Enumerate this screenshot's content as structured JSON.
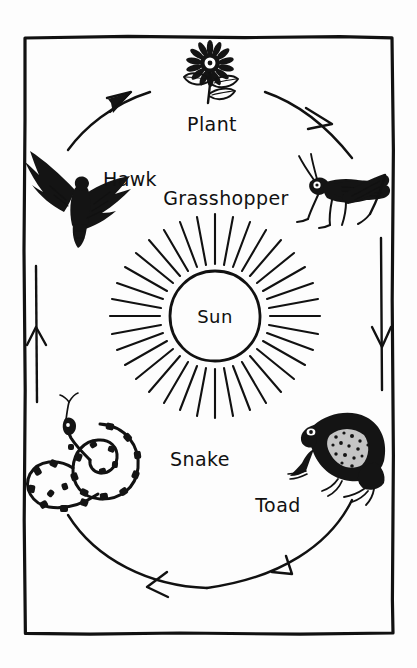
{
  "diagram": {
    "title_visible": false,
    "frame": {
      "type": "hand-drawn-rectangle",
      "color": "#111111"
    },
    "center": {
      "label": "Sun",
      "shape": "circle-with-rays",
      "ray_count": 36
    },
    "nodes": [
      {
        "id": "plant",
        "label": "Plant",
        "icon": "sunflower-illustration",
        "position": "top"
      },
      {
        "id": "grasshopper",
        "label": "Grasshopper",
        "icon": "grasshopper-illustration",
        "position": "right-upper"
      },
      {
        "id": "toad",
        "label": "Toad",
        "icon": "toad-illustration",
        "position": "right-lower"
      },
      {
        "id": "snake",
        "label": "Snake",
        "icon": "snake-illustration",
        "position": "left-lower"
      },
      {
        "id": "hawk",
        "label": "Hawk",
        "icon": "hawk-illustration",
        "position": "left-upper"
      }
    ],
    "arrows": [
      {
        "id": "plant-to-grasshopper",
        "from": "plant",
        "to": "grasshopper",
        "direction": "down-right"
      },
      {
        "id": "grasshopper-to-toad",
        "from": "grasshopper",
        "to": "toad",
        "direction": "down"
      },
      {
        "id": "toad-to-snake",
        "from": "toad",
        "to": "snake",
        "direction": "down-left"
      },
      {
        "id": "snake-to-hawk",
        "from": "snake",
        "to": "hawk",
        "direction": "up"
      },
      {
        "id": "hawk-to-plant",
        "from": "hawk",
        "to": "plant",
        "direction": "up-right"
      }
    ],
    "colors": {
      "ink": "#111111",
      "paper": "#fdfdfd"
    }
  }
}
